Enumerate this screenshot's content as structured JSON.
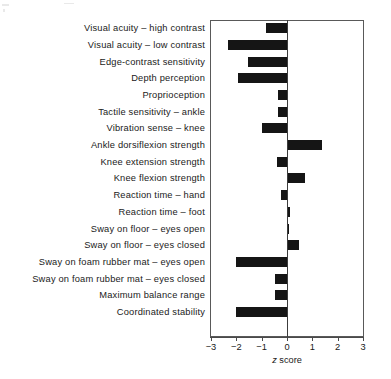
{
  "chart_data": {
    "type": "bar",
    "orientation": "horizontal",
    "title": "",
    "xlabel": "z score",
    "xlabel_italic_part": "z",
    "xlabel_plain_part": " score",
    "ylabel": "",
    "xlim": [
      -3,
      3
    ],
    "xticks": [
      -3,
      -2,
      -1,
      0,
      1,
      2,
      3
    ],
    "xtick_labels": [
      "−3",
      "−2",
      "−1",
      "0",
      "1",
      "2",
      "3"
    ],
    "grid": false,
    "legend": "none",
    "zero_reference_line": 0,
    "bar_color": "#151515",
    "frame_color": "#595959",
    "categories": [
      "Visual acuity – high contrast",
      "Visual acuity – low contrast",
      "Edge-contrast sensitivity",
      "Depth perception",
      "Proprioception",
      "Tactile sensitivity – ankle",
      "Vibration sense – knee",
      "Ankle dorsiflexion strength",
      "Knee extension strength",
      "Knee flexion strength",
      "Reaction time – hand",
      "Reaction time – foot",
      "Sway on floor – eyes open",
      "Sway on floor – eyes closed",
      "Sway on foam rubber mat – eyes open",
      "Sway on foam rubber mat – eyes closed",
      "Maximum balance range",
      "Coordinated stability"
    ],
    "values": [
      -0.83,
      -2.33,
      -1.54,
      -1.94,
      -0.36,
      -0.36,
      -1.0,
      1.38,
      -0.4,
      0.71,
      -0.24,
      0.12,
      0.08,
      0.47,
      -2.0,
      -0.47,
      -0.47,
      -2.0
    ]
  },
  "rows": [
    {
      "label": "Visual acuity – high contrast",
      "value": -0.83
    },
    {
      "label": "Visual acuity – low contrast",
      "value": -2.33
    },
    {
      "label": "Edge-contrast sensitivity",
      "value": -1.54
    },
    {
      "label": "Depth perception",
      "value": -1.94
    },
    {
      "label": "Proprioception",
      "value": -0.36
    },
    {
      "label": "Tactile sensitivity – ankle",
      "value": -0.36
    },
    {
      "label": "Vibration sense – knee",
      "value": -1.0
    },
    {
      "label": "Ankle dorsiflexion strength",
      "value": 1.38
    },
    {
      "label": "Knee extension strength",
      "value": -0.4
    },
    {
      "label": "Knee flexion strength",
      "value": 0.71
    },
    {
      "label": "Reaction time – hand",
      "value": -0.24
    },
    {
      "label": "Reaction time – foot",
      "value": 0.12
    },
    {
      "label": "Sway on floor – eyes open",
      "value": 0.08
    },
    {
      "label": "Sway on floor – eyes closed",
      "value": 0.47
    },
    {
      "label": "Sway on foam rubber mat – eyes open",
      "value": -2.0
    },
    {
      "label": "Sway on foam rubber mat – eyes closed",
      "value": -0.47
    },
    {
      "label": "Maximum balance range",
      "value": -0.47
    },
    {
      "label": "Coordinated stability",
      "value": -2.0
    }
  ],
  "axis": {
    "title_italic": "z",
    "title_rest": " score",
    "tick_labels": [
      "−3",
      "−2",
      "−1",
      "0",
      "1",
      "2",
      "3"
    ]
  }
}
